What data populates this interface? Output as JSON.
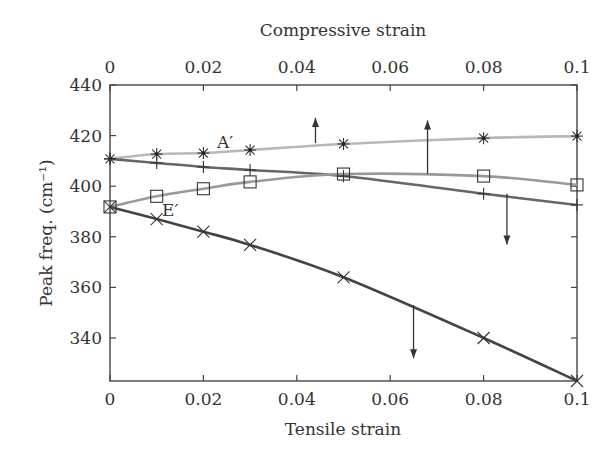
{
  "chart_data": {
    "type": "line",
    "title": "",
    "xlabel": "Tensile strain",
    "x2label": "Compressive strain",
    "ylabel": "Peak freq. (cm⁻¹)",
    "xlim": [
      0,
      0.1
    ],
    "ylim": [
      323,
      440
    ],
    "x_ticks": [
      "0",
      "0.02",
      "0.04",
      "0.06",
      "0.08",
      "0.1"
    ],
    "x_tick_values": [
      0,
      0.02,
      0.04,
      0.06,
      0.08,
      0.1
    ],
    "x2_ticks": [
      "0",
      "0.02",
      "0.04",
      "0.06",
      "0.08",
      "0.1"
    ],
    "y_ticks": [
      "440",
      "420",
      "400",
      "380",
      "360",
      "340"
    ],
    "y_tick_values": [
      440,
      420,
      400,
      380,
      360,
      340
    ],
    "grid": false,
    "legend": null,
    "x": [
      0,
      0.01,
      0.02,
      0.03,
      0.05,
      0.08,
      0.1
    ],
    "series": [
      {
        "name": "A′ (compressive)",
        "marker": "asterisk",
        "color": "#b8b8b8",
        "axis": "top",
        "values": [
          410.8,
          412.7,
          413.1,
          414.3,
          416.7,
          419.0,
          419.8
        ]
      },
      {
        "name": "A′ (tensile)",
        "marker": "plus",
        "color": "#666666",
        "axis": "bottom",
        "values": [
          410.8,
          409.2,
          407.6,
          406.4,
          404.0,
          397.0,
          392.6
        ]
      },
      {
        "name": "E′ (compressive)",
        "marker": "square",
        "color": "#999999",
        "axis": "top",
        "values": [
          391.8,
          396.0,
          399.0,
          401.7,
          404.8,
          404.0,
          400.5
        ]
      },
      {
        "name": "E′ (tensile)",
        "marker": "x",
        "color": "#444444",
        "axis": "bottom",
        "values": [
          391.8,
          387.0,
          382.0,
          376.8,
          364.0,
          340.0,
          323.0
        ]
      }
    ],
    "annotations": [
      {
        "text": "A′",
        "x": 0.025,
        "y": 416
      },
      {
        "text": "E′",
        "x": 0.012,
        "y": 390
      }
    ],
    "arrows": [
      {
        "direction": "up",
        "x": 0.044,
        "y_from": 417,
        "y_to": 427
      },
      {
        "direction": "up",
        "x": 0.068,
        "y_from": 405,
        "y_to": 426
      },
      {
        "direction": "down",
        "x": 0.085,
        "y_from": 397,
        "y_to": 377
      },
      {
        "direction": "down",
        "x": 0.065,
        "y_from": 353,
        "y_to": 332
      }
    ]
  }
}
